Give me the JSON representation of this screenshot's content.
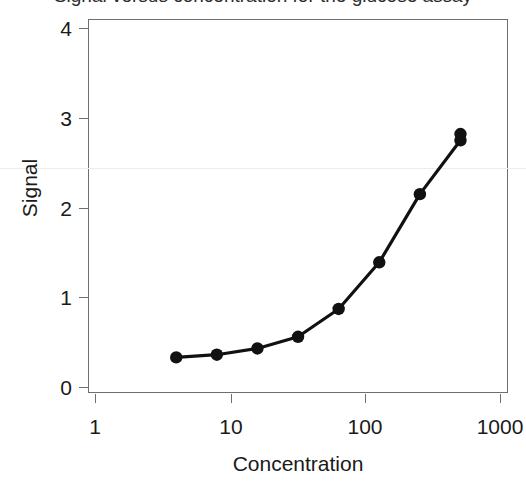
{
  "figure": {
    "title": "Signal versus concentration for the glucose assay",
    "title_clipped": true,
    "background_color": "#ffffff",
    "frame_color": "#6e6e6e",
    "series_color": "#111111"
  },
  "chart_data": {
    "type": "line",
    "title": "Signal versus concentration for the glucose assay",
    "xlabel": "Concentration",
    "ylabel": "Signal",
    "xscale": "log",
    "yscale": "linear",
    "xlim": [
      1,
      1000
    ],
    "ylim": [
      0,
      4.2
    ],
    "grid": false,
    "legend": null,
    "xticks": [
      1,
      10,
      100,
      1000
    ],
    "xtick_labels": [
      "1",
      "10",
      "100",
      "1000"
    ],
    "yticks": [
      0,
      1,
      2,
      3,
      4
    ],
    "ytick_labels": [
      "0",
      "1",
      "2",
      "3",
      "4"
    ],
    "marker": "filled-circle",
    "series": [
      {
        "name": "Signal",
        "x": [
          4,
          8,
          16,
          32,
          64,
          128,
          256,
          512,
          512
        ],
        "values": [
          0.33,
          0.36,
          0.43,
          0.56,
          0.87,
          1.39,
          2.15,
          2.75,
          2.82
        ]
      }
    ],
    "points": [
      {
        "concentration": 4,
        "signal": 0.33
      },
      {
        "concentration": 8,
        "signal": 0.36
      },
      {
        "concentration": 16,
        "signal": 0.43
      },
      {
        "concentration": 32,
        "signal": 0.56
      },
      {
        "concentration": 64,
        "signal": 0.87
      },
      {
        "concentration": 128,
        "signal": 1.39
      },
      {
        "concentration": 256,
        "signal": 2.15
      },
      {
        "concentration": 512,
        "signal": 2.75
      },
      {
        "concentration": 512,
        "signal": 2.82
      }
    ]
  },
  "axes": {
    "x": {
      "label": "Concentration",
      "ticks": [
        {
          "label": "1",
          "value": 1
        },
        {
          "label": "10",
          "value": 10
        },
        {
          "label": "100",
          "value": 100
        },
        {
          "label": "1000",
          "value": 1000
        }
      ]
    },
    "y": {
      "label": "Signal",
      "ticks": [
        {
          "label": "4",
          "value": 4
        },
        {
          "label": "3",
          "value": 3
        },
        {
          "label": "2",
          "value": 2
        },
        {
          "label": "1",
          "value": 1
        },
        {
          "label": "0",
          "value": 0
        }
      ]
    }
  }
}
